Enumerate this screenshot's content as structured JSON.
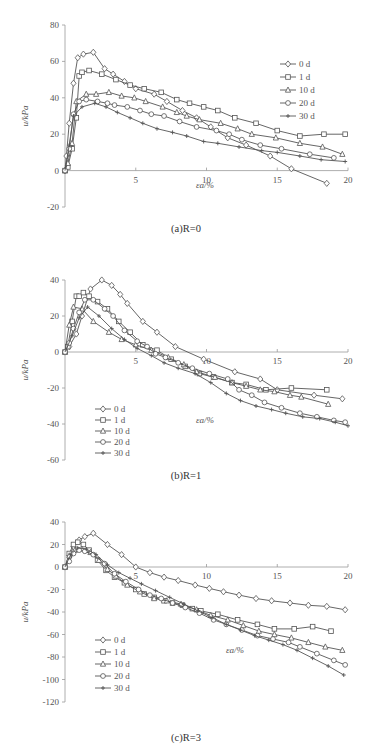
{
  "chart_data": [
    {
      "type": "line",
      "caption": "(a)R=0",
      "xlabel": "εa/%",
      "ylabel": "u/kPa",
      "xlim": [
        0,
        20
      ],
      "ylim": [
        -20,
        80
      ],
      "xticks": [
        5,
        10,
        15,
        20
      ],
      "yticks": [
        -20,
        0,
        20,
        40,
        60,
        80
      ],
      "grid": false,
      "legend_position": "upper right",
      "series": [
        {
          "name": "0 d",
          "marker": "diamond",
          "x": [
            0,
            0.1,
            0.3,
            0.6,
            0.9,
            1.3,
            2.0,
            2.8,
            3.4,
            4.2,
            5.0,
            6.3,
            7.2,
            8.3,
            9.3,
            10.3,
            11.5,
            12.8,
            14.5,
            16.0,
            18.5
          ],
          "y": [
            0,
            8,
            26,
            48,
            62,
            64,
            65,
            56,
            53,
            49,
            45,
            42,
            38,
            33,
            29,
            24,
            18,
            14,
            8,
            1,
            -7
          ]
        },
        {
          "name": "1 d",
          "marker": "square",
          "x": [
            0,
            0.2,
            0.5,
            0.8,
            1.0,
            1.2,
            1.7,
            2.6,
            3.6,
            4.6,
            5.6,
            6.8,
            7.9,
            8.8,
            9.8,
            10.8,
            12.0,
            13.5,
            15.0,
            16.6,
            18.3,
            19.8
          ],
          "y": [
            0,
            2,
            12,
            29,
            52,
            54,
            55,
            53,
            50,
            47,
            45,
            43,
            39,
            37,
            35,
            33,
            29,
            26,
            22,
            19,
            20,
            20
          ]
        },
        {
          "name": "10 d",
          "marker": "triangle",
          "x": [
            0,
            0.2,
            0.5,
            0.8,
            1.5,
            2.2,
            3.1,
            4.0,
            4.9,
            5.7,
            6.9,
            7.9,
            8.6,
            9.5,
            11.0,
            12.2,
            13.2,
            14.9,
            16.6,
            18.2,
            19.6
          ],
          "y": [
            0,
            4,
            15,
            38,
            42,
            42,
            43,
            41,
            40,
            38,
            35,
            32,
            30,
            28,
            26,
            23,
            20,
            18,
            15,
            13,
            9
          ]
        },
        {
          "name": "20 d",
          "marker": "circle",
          "x": [
            0,
            0.3,
            0.6,
            1.0,
            1.5,
            2.3,
            3.0,
            3.5,
            4.4,
            5.3,
            6.1,
            7.0,
            8.1,
            9.3,
            10.7,
            11.6,
            12.5,
            13.8,
            15.3,
            17.3,
            19.0
          ],
          "y": [
            0,
            12,
            31,
            38,
            39,
            38,
            37,
            36,
            35,
            33,
            31,
            30,
            27,
            24,
            22,
            20,
            17,
            14,
            12,
            9,
            7
          ]
        },
        {
          "name": "30 d",
          "marker": "plus",
          "x": [
            0,
            0.3,
            0.6,
            1.2,
            2.1,
            2.9,
            3.7,
            4.6,
            5.5,
            6.5,
            7.6,
            8.6,
            9.8,
            10.8,
            12.3,
            13.9,
            15.0,
            16.6,
            18.1,
            19.8
          ],
          "y": [
            0,
            14,
            30,
            35,
            37,
            35,
            32,
            29,
            26,
            23,
            21,
            19,
            16,
            15,
            13,
            11,
            10,
            8,
            6,
            5
          ]
        }
      ]
    },
    {
      "type": "line",
      "caption": "(b)R=1",
      "xlabel": "εa/%",
      "ylabel": "u/kPa",
      "xlim": [
        0,
        20
      ],
      "ylim": [
        -60,
        40
      ],
      "xticks": [
        5,
        10,
        15,
        20
      ],
      "yticks": [
        -60,
        -40,
        -20,
        0,
        20,
        40
      ],
      "grid": false,
      "legend_position": "lower left",
      "series": [
        {
          "name": "0 d",
          "marker": "diamond",
          "x": [
            0,
            0.3,
            0.8,
            1.2,
            1.8,
            2.6,
            3.3,
            3.9,
            4.4,
            5.5,
            6.5,
            7.8,
            9.8,
            12.0,
            13.8,
            15.0,
            17.6,
            19.6
          ],
          "y": [
            0,
            3,
            10,
            20,
            35,
            40,
            37,
            32,
            27,
            17,
            11,
            3,
            -4,
            -11,
            -15,
            -21,
            -24,
            -26
          ]
        },
        {
          "name": "1 d",
          "marker": "square",
          "x": [
            0,
            0.2,
            0.5,
            0.8,
            1.0,
            1.3,
            1.7,
            2.3,
            3.0,
            3.8,
            4.6,
            5.5,
            6.5,
            7.5,
            8.5,
            9.5,
            10.5,
            11.8,
            12.8,
            14.2,
            16.0,
            18.5
          ],
          "y": [
            0,
            3,
            17,
            31,
            31,
            33,
            31,
            28,
            24,
            17,
            11,
            4,
            1,
            -4,
            -8,
            -12,
            -14,
            -17,
            -18,
            -21,
            -20,
            -21
          ]
        },
        {
          "name": "10 d",
          "marker": "triangle",
          "x": [
            0,
            0.3,
            0.6,
            1.2,
            2.0,
            3.1,
            4.0,
            5.0,
            6.1,
            7.3,
            8.4,
            9.3,
            10.6,
            11.8,
            12.8,
            13.8,
            14.8,
            15.9,
            16.7,
            18.6
          ],
          "y": [
            0,
            15,
            25,
            24,
            17,
            11,
            7,
            4,
            1,
            -3,
            -7,
            -11,
            -14,
            -17,
            -19,
            -21,
            -22,
            -24,
            -25,
            -29
          ]
        },
        {
          "name": "20 d",
          "marker": "circle",
          "x": [
            0,
            0.3,
            0.6,
            1.0,
            1.4,
            2.0,
            2.8,
            3.4,
            4.2,
            5.1,
            5.8,
            6.4,
            7.1,
            8.0,
            9.0,
            10.2,
            11.5,
            12.3,
            13.2,
            14.1,
            15.3,
            16.6,
            17.8,
            19.0,
            19.8
          ],
          "y": [
            0,
            5,
            13,
            22,
            29,
            29,
            24,
            20,
            12,
            6,
            3,
            -1,
            -3,
            -6,
            -9,
            -12,
            -15,
            -21,
            -24,
            -28,
            -31,
            -34,
            -36,
            -38,
            -39
          ]
        },
        {
          "name": "30 d",
          "marker": "plus",
          "x": [
            0,
            0.5,
            1.0,
            1.6,
            2.4,
            3.3,
            4.2,
            5.1,
            6.1,
            7.0,
            8.0,
            9.2,
            10.3,
            11.4,
            12.4,
            13.5,
            14.6,
            15.6,
            16.8,
            18.0,
            19.1,
            20.0
          ],
          "y": [
            0,
            9,
            19,
            25,
            20,
            13,
            7,
            2,
            -2,
            -6,
            -9,
            -12,
            -17,
            -23,
            -27,
            -30,
            -32,
            -34,
            -36,
            -37,
            -39,
            -41
          ]
        }
      ]
    },
    {
      "type": "line",
      "caption": "(c)R=3",
      "xlabel": "εa/%",
      "ylabel": "u/kPa",
      "xlim": [
        0,
        20
      ],
      "ylim": [
        -120,
        40
      ],
      "xticks": [
        5,
        10,
        15,
        20
      ],
      "yticks": [
        -120,
        -100,
        -80,
        -60,
        -40,
        -20,
        0,
        20,
        40
      ],
      "grid": false,
      "legend_position": "lower left",
      "series": [
        {
          "name": "0 d",
          "marker": "diamond",
          "x": [
            0,
            0.3,
            0.6,
            1.0,
            1.4,
            2.0,
            3.0,
            4.0,
            5.0,
            6.0,
            7.0,
            8.0,
            9.2,
            10.2,
            11.2,
            12.3,
            13.5,
            14.6,
            15.9,
            17.2,
            18.5,
            19.8
          ],
          "y": [
            0,
            10,
            18,
            24,
            27,
            30,
            20,
            11,
            0,
            -5,
            -9,
            -12,
            -16,
            -19,
            -22,
            -25,
            -28,
            -30,
            -32,
            -34,
            -35,
            -38
          ]
        },
        {
          "name": "1 d",
          "marker": "square",
          "x": [
            0,
            0.3,
            0.6,
            0.9,
            1.3,
            1.7,
            2.3,
            2.9,
            3.5,
            4.2,
            5.0,
            5.6,
            6.3,
            7.0,
            7.6,
            8.3,
            9.0,
            9.6,
            10.8,
            12.2,
            13.6,
            14.8,
            16.2,
            17.5,
            18.8
          ],
          "y": [
            0,
            12,
            20,
            22,
            20,
            15,
            6,
            -3,
            -9,
            -14,
            -20,
            -24,
            -27,
            -30,
            -32,
            -34,
            -37,
            -39,
            -42,
            -47,
            -51,
            -55,
            -55,
            -53,
            -57
          ]
        },
        {
          "name": "10 d",
          "marker": "triangle",
          "x": [
            0,
            0.3,
            0.7,
            1.2,
            1.8,
            2.4,
            3.0,
            3.6,
            4.4,
            5.3,
            6.3,
            7.2,
            8.2,
            9.3,
            10.3,
            11.5,
            12.6,
            13.7,
            14.8,
            16.0,
            17.2,
            18.4,
            19.6
          ],
          "y": [
            0,
            10,
            15,
            16,
            13,
            6,
            -2,
            -8,
            -16,
            -22,
            -28,
            -30,
            -33,
            -38,
            -43,
            -47,
            -52,
            -57,
            -60,
            -63,
            -67,
            -71,
            -74
          ]
        },
        {
          "name": "20 d",
          "marker": "circle",
          "x": [
            0,
            0.3,
            0.6,
            1.0,
            1.4,
            2.0,
            2.8,
            3.5,
            4.3,
            5.2,
            6.0,
            6.8,
            7.6,
            8.5,
            9.5,
            10.5,
            11.4,
            12.5,
            13.6,
            14.7,
            15.8,
            16.6,
            17.8,
            19.0,
            19.8
          ],
          "y": [
            0,
            5,
            12,
            15,
            14,
            11,
            3,
            -6,
            -13,
            -20,
            -25,
            -28,
            -32,
            -36,
            -41,
            -47,
            -51,
            -56,
            -61,
            -64,
            -67,
            -71,
            -77,
            -83,
            -87
          ]
        },
        {
          "name": "30 d",
          "marker": "plus",
          "x": [
            0,
            0.4,
            0.9,
            1.5,
            2.2,
            3.0,
            3.8,
            4.6,
            5.4,
            6.4,
            7.4,
            8.4,
            9.4,
            10.4,
            11.4,
            12.4,
            13.4,
            14.4,
            15.4,
            16.4,
            17.5,
            18.6,
            19.7
          ],
          "y": [
            0,
            11,
            17,
            16,
            11,
            2,
            -5,
            -10,
            -15,
            -21,
            -27,
            -33,
            -39,
            -45,
            -51,
            -56,
            -61,
            -65,
            -69,
            -74,
            -81,
            -88,
            -96
          ]
        }
      ]
    }
  ],
  "charts": [
    {
      "caption": "(a)R=0",
      "ylabel": "u/kPa",
      "xlabel": "εa/%"
    },
    {
      "caption": "(b)R=1",
      "ylabel": "u/kPa",
      "xlabel": "εa/%"
    },
    {
      "caption": "(c)R=3",
      "ylabel": "u/kPa",
      "xlabel": "εa/%"
    }
  ]
}
